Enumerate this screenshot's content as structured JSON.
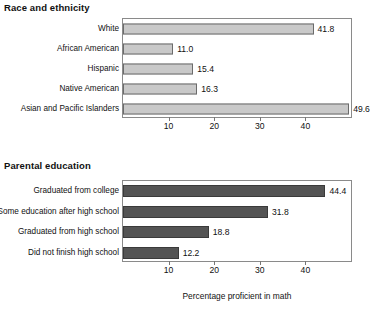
{
  "chart_data": [
    {
      "type": "bar",
      "orientation": "horizontal",
      "title": "Race and ethnicity",
      "categories": [
        "White",
        "African American",
        "Hispanic",
        "Native American",
        "Asian and Pacific Islanders"
      ],
      "values": [
        41.8,
        11.0,
        15.4,
        16.3,
        49.6
      ],
      "value_labels": [
        "41.8",
        "11.0",
        "15.4",
        "16.3",
        "49.6"
      ],
      "xlabel": "",
      "ylabel": "",
      "xticks": [
        10,
        20,
        30,
        40
      ],
      "xtick_labels": [
        "10",
        "20",
        "30",
        "40"
      ],
      "xlim": [
        0,
        50
      ],
      "grid": false,
      "legend": false,
      "bar_color": "#c9c9c9",
      "bar_edge_color": "#6b6b6b"
    },
    {
      "type": "bar",
      "orientation": "horizontal",
      "title": "Parental education",
      "categories": [
        "Graduated from college",
        "Some education after high school",
        "Graduated from high school",
        "Did not finish high school"
      ],
      "values": [
        44.4,
        31.8,
        18.8,
        12.2
      ],
      "value_labels": [
        "44.4",
        "31.8",
        "18.8",
        "12.2"
      ],
      "xlabel": "Percentage proficient in math",
      "ylabel": "",
      "xticks": [
        10,
        20,
        30,
        40
      ],
      "xtick_labels": [
        "10",
        "20",
        "30",
        "40"
      ],
      "xlim": [
        0,
        50
      ],
      "grid": false,
      "legend": false,
      "bar_color": "#545454",
      "bar_edge_color": "#3a3a3a"
    }
  ]
}
